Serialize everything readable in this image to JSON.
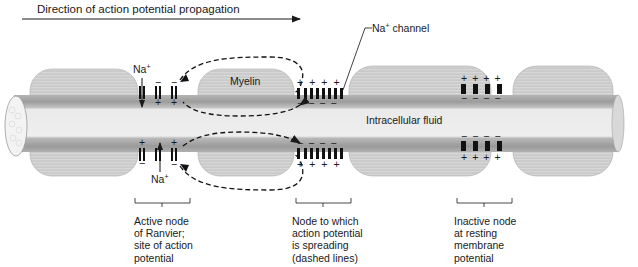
{
  "header": {
    "title": "Direction of action potential propagation"
  },
  "labels": {
    "myelin": "Myelin",
    "intracellular": "Intracellular fluid",
    "na_channel": "Na",
    "na_channel_sup": "+",
    "na_channel_suffix": " channel",
    "na_top": "Na",
    "na_top_sup": "+",
    "na_bottom": "Na",
    "na_bottom_sup": "+"
  },
  "nodes": [
    {
      "id": "active",
      "lines": [
        "Active node",
        "of Ranvier;",
        "site of action",
        "potential"
      ]
    },
    {
      "id": "spreading",
      "lines": [
        "Node to which",
        "action potential",
        "is spreading",
        "(dashed lines)"
      ]
    },
    {
      "id": "inactive",
      "lines": [
        "Inactive node",
        "at resting",
        "membrane",
        "potential"
      ]
    }
  ],
  "signs": {
    "plus": "+",
    "minus": "−"
  },
  "colors": {
    "ink": "#1a1a1a",
    "axon_dark": "#9a9a9a",
    "axon_light": "#ececec",
    "myelin": "#c8c8c8",
    "background": "#ffffff"
  }
}
